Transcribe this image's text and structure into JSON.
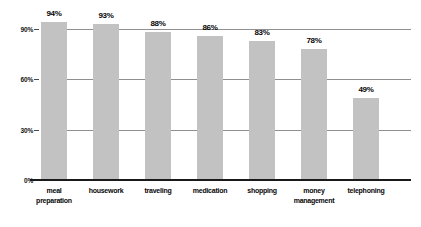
{
  "chart_data": {
    "type": "bar",
    "title": "",
    "subtitle": "",
    "xlabel": "",
    "ylabel": "",
    "categories": [
      "meal\npreparation",
      "housework",
      "traveling",
      "medication",
      "shopping",
      "money\nmanagement",
      "telephoning"
    ],
    "values": [
      94,
      93,
      88,
      86,
      83,
      78,
      49
    ],
    "data_labels": [
      "94%",
      "93%",
      "88%",
      "86%",
      "83%",
      "78%",
      "49%"
    ],
    "ylim": [
      0,
      100
    ],
    "yticks": [
      0,
      30,
      60,
      90
    ],
    "ytick_labels": [
      "0%",
      "30%",
      "60%",
      "90%"
    ],
    "grid": true,
    "legend": "none",
    "series": [
      {
        "name": "percent",
        "values": [
          94,
          93,
          88,
          86,
          83,
          78,
          49
        ]
      }
    ],
    "colors": {
      "bar_fill": "#c2c2c2",
      "gridline": "#8f8f8f",
      "axis": "#1a1a1a",
      "text": "#070707",
      "background": "#ffffff"
    }
  }
}
